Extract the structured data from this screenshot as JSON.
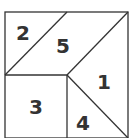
{
  "diagram": {
    "stroke_color": "#333333",
    "background": "#ffffff",
    "regions": [
      {
        "id": "region-1",
        "label": "1"
      },
      {
        "id": "region-2",
        "label": "2"
      },
      {
        "id": "region-3",
        "label": "3"
      },
      {
        "id": "region-4",
        "label": "4"
      },
      {
        "id": "region-5",
        "label": "5"
      }
    ]
  }
}
